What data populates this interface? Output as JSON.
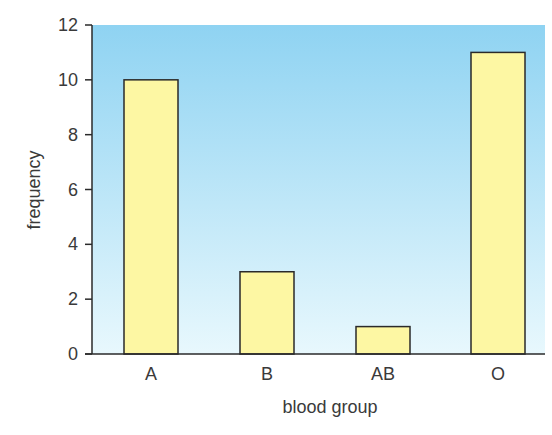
{
  "chart_data": {
    "type": "bar",
    "title": "",
    "xlabel": "blood group",
    "ylabel": "frequency",
    "categories": [
      "A",
      "B",
      "AB",
      "O"
    ],
    "values": [
      10,
      3,
      1,
      11
    ],
    "ylim": [
      0,
      12
    ],
    "yticks": [
      0,
      2,
      4,
      6,
      8,
      10,
      12
    ],
    "grid": false,
    "legend": null,
    "colors": {
      "bar_fill": "#fdf7a3",
      "bar_stroke": "#2a2a2a",
      "background_top": "#8fd3f2",
      "background_bottom": "#e6f7fd"
    }
  }
}
